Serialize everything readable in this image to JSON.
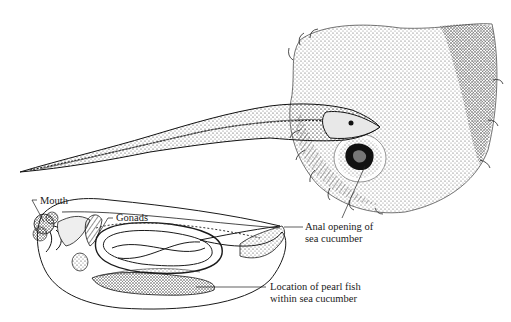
{
  "diagram": {
    "top_illustration": {
      "description": "Pearl fish entering anal opening of sea cucumber"
    },
    "bottom_illustration": {
      "description": "Cutaway of sea cucumber showing internal anatomy and pearl fish location"
    },
    "labels": {
      "mouth": "Mouth",
      "gonads": "Gonads",
      "anal_opening_line1": "Anal opening of",
      "anal_opening_line2": "sea cucumber",
      "location_line1": "Location of pearl fish",
      "location_line2": "within sea cucumber"
    },
    "colors": {
      "ink": "#1a1a1a",
      "background": "#ffffff"
    }
  }
}
